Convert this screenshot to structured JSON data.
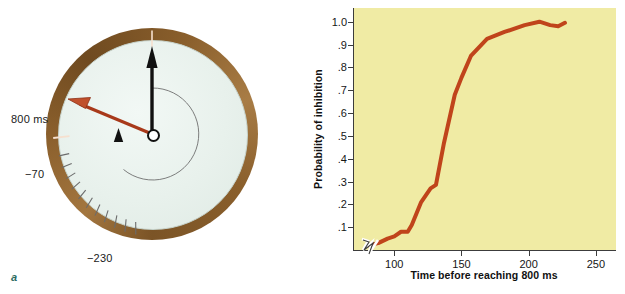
{
  "figure": {
    "panel_a_letter": "a",
    "panel_b_letter": "b"
  },
  "clock": {
    "label_800ms": "800 ms",
    "label_minus70": "−70",
    "label_minus230": "−230",
    "rim_color": "#8a5f2c",
    "face_color": "#e8f1ec",
    "black_hand_color": "#111111",
    "red_hand_color": "#b4401f",
    "black_hand_angle_deg": 0,
    "red_hand_angle_deg": 297,
    "small_pointer_angle_deg": 333,
    "tick_count": 11
  },
  "chart_data": {
    "type": "line",
    "title": "",
    "subtitle": "",
    "xlabel": "Time before reaching 800 ms",
    "ylabel": "Probability of inhibition",
    "xlim": [
      70,
      265
    ],
    "ylim": [
      0,
      1.06
    ],
    "grid": false,
    "legend": null,
    "axis_break_x": true,
    "background_color": "#f0eba4",
    "line_color": "#c0441b",
    "line_width": 4,
    "xticks": [
      100,
      150,
      200,
      250
    ],
    "xtick_labels": [
      "100",
      "150",
      "200",
      "250"
    ],
    "yticks": [
      0.1,
      0.2,
      0.3,
      0.4,
      0.5,
      0.6,
      0.7,
      0.8,
      0.9,
      1.0
    ],
    "ytick_labels": [
      ".1",
      ".2",
      ".3",
      ".4",
      ".5",
      ".6",
      ".7",
      ".8",
      ".9",
      "1.0"
    ],
    "series": [
      {
        "name": "Probability of inhibition",
        "x": [
          80,
          88,
          95,
          100,
          105,
          110,
          113,
          120,
          127,
          131,
          137,
          145,
          150,
          157,
          169,
          182,
          197,
          208,
          216,
          222,
          227
        ],
        "y": [
          0.02,
          0.03,
          0.05,
          0.06,
          0.08,
          0.08,
          0.11,
          0.21,
          0.27,
          0.285,
          0.47,
          0.68,
          0.755,
          0.85,
          0.925,
          0.955,
          0.985,
          1.0,
          0.985,
          0.98,
          0.995
        ]
      }
    ]
  }
}
